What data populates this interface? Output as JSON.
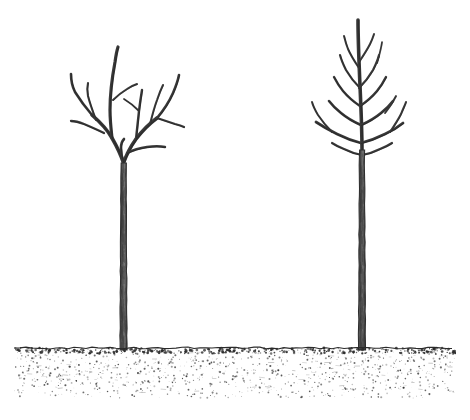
{
  "figure": {
    "title": "Two bare young trees planted in soil",
    "medium": "pen-and-ink line drawing with stipple shading",
    "background_color": "#ffffff",
    "ink_color": "#3a3a3a",
    "ink_dark_color": "#222222",
    "canvas": {
      "width": 470,
      "height": 420
    }
  },
  "ground": {
    "name": "soil-band",
    "surface_line_y": 348,
    "bottom_y": 398,
    "left_x": 14,
    "right_x": 456,
    "fill_style": "stipple",
    "crust_color": "#2b2b2b",
    "speckle_color": "#4a4a4a",
    "speckle_count": 1500,
    "crust_speckle_count": 420
  },
  "trees": [
    {
      "id": "tree-left",
      "label": "Left tree",
      "form": "open-center vase",
      "trunk": {
        "base_x": 123.5,
        "base_y": 350,
        "top_y": 163,
        "width_base": 7.0,
        "width_top": 5.2,
        "shade_color": "#595959"
      },
      "crown": {
        "fork_y": 163,
        "top_y": 47,
        "left_extent_x": 68,
        "right_extent_x": 182,
        "scaffold_count": 4
      },
      "branches": [
        {
          "d": "M123.5 163 C 120 152, 116 145, 112 138 C 107 129, 100 122, 92 115",
          "w": 3.6
        },
        {
          "d": "M92 115 C 86 108, 80 100, 75 92 C 72 86, 71 80, 71 74",
          "w": 2.6
        },
        {
          "d": "M104 133 C 98 130, 91 127, 84 124 C 79 122, 75 121, 71 121",
          "w": 2.3
        },
        {
          "d": "M96 120 C 93 112, 90 104, 88 96 C 87 91, 87 87, 88 83",
          "w": 2.1
        },
        {
          "d": "M112 138 C 111 129, 110 120, 110 110 C 110 96, 112 78, 115 62 C 116 55, 117 50, 118 47",
          "w": 3.2
        },
        {
          "d": "M113 100 C 117 96, 122 92, 127 89 C 131 86, 134 85, 137 84",
          "w": 2.0
        },
        {
          "d": "M123.5 163 C 127 153, 131 146, 136 139 C 142 131, 149 124, 157 118",
          "w": 3.6
        },
        {
          "d": "M136 139 C 137 130, 138 120, 139 111 C 140 103, 141 96, 142 90",
          "w": 2.4
        },
        {
          "d": "M139 111 C 134 106, 129 102, 124 99",
          "w": 1.8
        },
        {
          "d": "M157 118 C 163 111, 169 102, 173 93 C 176 86, 178 80, 179 75",
          "w": 2.6
        },
        {
          "d": "M157 118 C 163 120, 169 122, 175 124 C 179 125, 182 126, 184 127",
          "w": 2.2
        },
        {
          "d": "M150 124 C 152 116, 154 108, 157 100 C 159 94, 161 89, 163 85",
          "w": 2.0
        },
        {
          "d": "M127 153 C 133 150, 140 148, 147 147 C 154 146, 160 146, 165 147",
          "w": 2.4
        },
        {
          "d": "M123.5 163 C 122 158, 121 153, 121 148 C 121 144, 122 141, 124 139",
          "w": 2.6
        }
      ]
    },
    {
      "id": "tree-right",
      "label": "Right tree",
      "form": "central leader",
      "trunk": {
        "base_x": 362,
        "base_y": 350,
        "top_y": 150,
        "width_base": 7.0,
        "width_top": 5.0,
        "shade_color": "#595959"
      },
      "crown": {
        "leader_top_y": 20,
        "left_extent_x": 308,
        "right_extent_x": 414,
        "whorl_count": 5
      },
      "branches": [
        {
          "d": "M362 150 C 362 130, 361 108, 360 86 C 359 62, 358 40, 358 20",
          "w": 3.6
        },
        {
          "d": "M361 143 C 353 141, 345 138, 337 134 C 329 130, 322 126, 316 122",
          "w": 2.8
        },
        {
          "d": "M332 132 C 327 127, 322 121, 318 115 C 315 110, 313 106, 312 102",
          "w": 2.0
        },
        {
          "d": "M361 143 C 369 141, 377 138, 385 134 C 392 131, 398 127, 403 123",
          "w": 2.8
        },
        {
          "d": "M390 132 C 394 126, 398 120, 401 114 C 403 109, 405 105, 406 102",
          "w": 2.0
        },
        {
          "d": "M361 125 C 354 122, 347 118, 341 113 C 336 109, 332 105, 329 101",
          "w": 2.6
        },
        {
          "d": "M361 125 C 368 122, 375 118, 381 113 C 386 109, 390 105, 393 101",
          "w": 2.6
        },
        {
          "d": "M385 113 C 389 108, 393 102, 396 96",
          "w": 1.8
        },
        {
          "d": "M360 106 C 354 102, 348 97, 343 91 C 339 86, 336 81, 334 77",
          "w": 2.4
        },
        {
          "d": "M360 106 C 366 102, 372 97, 377 91 C 381 86, 384 81, 386 77",
          "w": 2.4
        },
        {
          "d": "M360 88 C 355 83, 350 77, 346 70 C 343 64, 341 59, 340 55",
          "w": 2.2
        },
        {
          "d": "M359 88 C 364 83, 369 77, 373 70 C 376 64, 378 59, 379 55",
          "w": 2.2
        },
        {
          "d": "M377 63 C 379 56, 381 49, 382 42",
          "w": 1.7
        },
        {
          "d": "M359 68 C 355 62, 351 56, 348 49 C 346 44, 345 40, 344 36",
          "w": 2.0
        },
        {
          "d": "M359 62 C 363 56, 367 50, 370 44 C 372 40, 373 37, 374 34",
          "w": 1.9
        },
        {
          "d": "M362 155 C 356 154, 350 152, 344 149 C 339 147, 335 145, 332 143",
          "w": 2.2
        },
        {
          "d": "M362 155 C 368 154, 374 152, 380 149 C 385 147, 389 145, 392 143",
          "w": 2.2
        }
      ]
    }
  ],
  "caption": {
    "visible": false,
    "text": ""
  }
}
